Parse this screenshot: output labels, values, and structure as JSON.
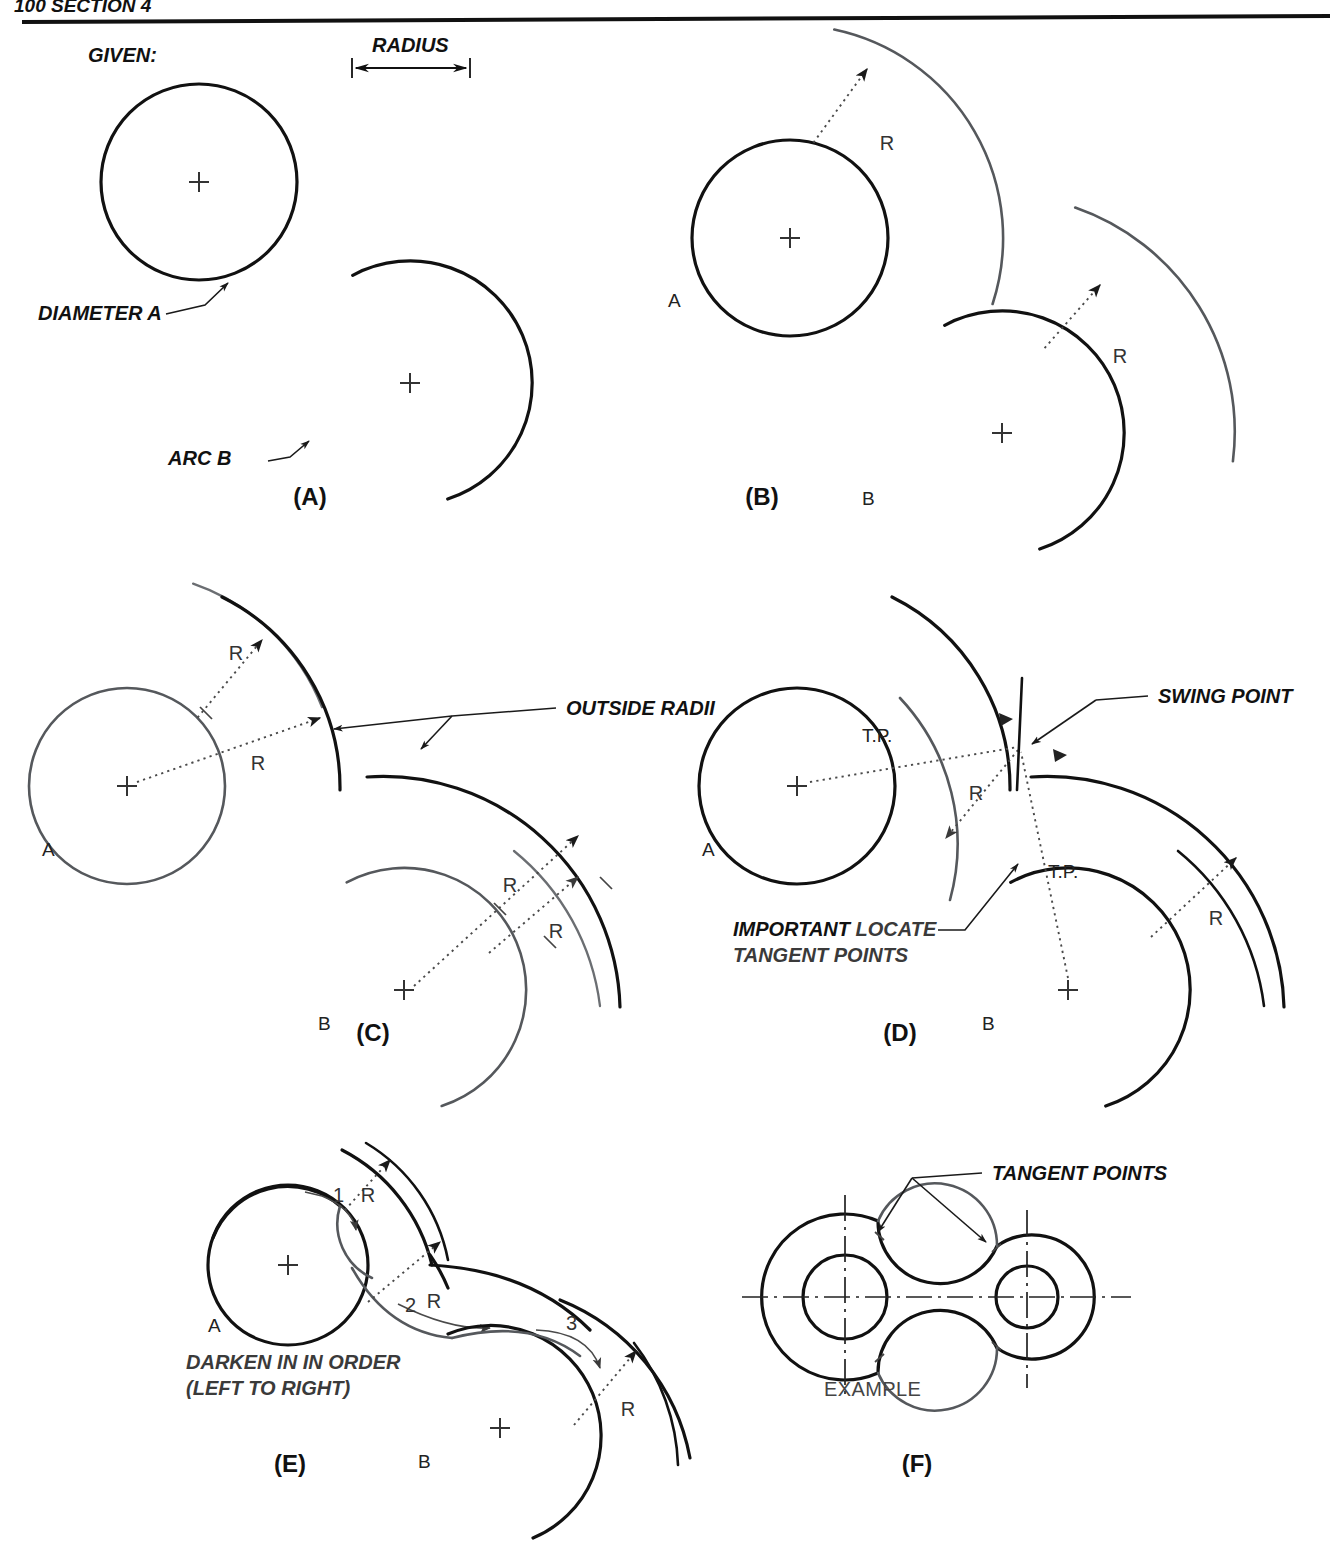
{
  "page": {
    "header_left": "100  SECTION 4",
    "background": "#ffffff",
    "ink_dark": "#111111",
    "ink_gray": "#55585c",
    "construction": "#4a4a4a"
  },
  "legend": {
    "given_label": "GIVEN:",
    "radius_label": "RADIUS",
    "diameter_label": "DIAMETER A",
    "arc_label": "ARC B"
  },
  "panels": [
    {
      "id": "A",
      "caption": "(A)",
      "caption_x": 310,
      "caption_y": 505,
      "notes": []
    },
    {
      "id": "B",
      "caption": "(B)",
      "caption_x": 762,
      "caption_y": 505,
      "notes": []
    },
    {
      "id": "C",
      "caption": "(C)",
      "caption_x": 373,
      "caption_y": 1041,
      "notes": [
        "OUTSIDE RADII"
      ]
    },
    {
      "id": "D",
      "caption": "(D)",
      "caption_x": 900,
      "caption_y": 1041,
      "notes": [
        "SWING POINT",
        "T.P.",
        "IMPORTANT",
        "LOCATE",
        "TANGENT POINTS"
      ]
    },
    {
      "id": "E",
      "caption": "(E)",
      "caption_x": 290,
      "caption_y": 1472,
      "notes": [
        "DARKEN IN IN ORDER",
        "(LEFT TO RIGHT)",
        "1",
        "2",
        "3"
      ]
    },
    {
      "id": "F",
      "caption": "(F)",
      "caption_x": 917,
      "caption_y": 1472,
      "notes": [
        "TANGENT POINTS",
        "EXAMPLE"
      ]
    }
  ],
  "labels": {
    "R": "R",
    "A": "A",
    "B": "B",
    "tp": "T.P.",
    "swing_point": "SWING POINT",
    "outside_radii": "OUTSIDE RADII",
    "important": "IMPORTANT",
    "locate": " LOCATE",
    "tangent_points_line2": "TANGENT POINTS",
    "tangent_points": "TANGENT POINTS",
    "darken_line1": "DARKEN IN IN ORDER",
    "darken_line2": "(LEFT TO RIGHT)",
    "example": "EXAMPLE",
    "step1": "1",
    "step2": "2",
    "step3": "3"
  },
  "geometry": {
    "panelA": {
      "circleA": {
        "cx": 199,
        "cy": 182,
        "r": 98
      },
      "arcB": {
        "cx": 410,
        "cy": 383,
        "r": 122,
        "start_deg": 118,
        "end_deg": -72
      },
      "radius_dim": {
        "x1": 352,
        "y1": 68,
        "x2": 470,
        "y2": 68,
        "length_px": 118
      }
    },
    "panelB": {
      "circleA": {
        "cx": 790,
        "cy": 238,
        "r": 98
      },
      "arcB": {
        "cx": 1002,
        "cy": 433,
        "r": 122,
        "start_deg": 118,
        "end_deg": -72
      },
      "offsetA": {
        "cx": 790,
        "cy": 238,
        "r": 213,
        "start_deg": 78,
        "end_deg": 18
      },
      "offsetB": {
        "cx": 1002,
        "cy": 433,
        "r": 237,
        "start_deg": 72,
        "end_deg": 14
      },
      "radius_value_px": 115
    },
    "panelC": {
      "circleA": {
        "cx": 127,
        "cy": 786,
        "r": 98
      },
      "arcB": {
        "cx": 404,
        "cy": 990,
        "r": 122,
        "start_deg": 118,
        "end_deg": -72
      },
      "outer1": {
        "cx": 127,
        "cy": 786,
        "r": 213
      },
      "outer2": {
        "cx": 404,
        "cy": 990,
        "r": 237
      }
    },
    "panelD": {
      "circleA": {
        "cx": 797,
        "cy": 786,
        "r": 98
      },
      "arcB": {
        "cx": 1068,
        "cy": 990,
        "r": 122,
        "start_deg": 118,
        "end_deg": -72
      },
      "swing_point": {
        "x": 1020,
        "y": 745
      },
      "tp1": {
        "x": 897,
        "y": 760
      },
      "tp2": {
        "x": 1022,
        "y": 862
      }
    },
    "panelE": {
      "circleA": {
        "cx": 288,
        "cy": 1265,
        "r": 80
      },
      "arcB": {
        "cx": 500,
        "cy": 1428,
        "r": 110,
        "start_deg": 118,
        "end_deg": -72
      }
    },
    "panelF": {
      "left_boss": {
        "cx": 845,
        "cy": 1297,
        "r_out": 83,
        "r_bore": 42
      },
      "right_boss": {
        "cx": 1027,
        "cy": 1297,
        "r_out": 62,
        "r_bore": 31
      },
      "fillet_radius": 62,
      "centerline_h": {
        "x1": 742,
        "y1": 1297,
        "x2": 1131,
        "y2": 1297
      },
      "centerline_v_left": {
        "x": 845,
        "y1": 1195,
        "y2": 1400
      },
      "centerline_v_right": {
        "x": 1027,
        "y1": 1210,
        "y2": 1388
      }
    }
  }
}
